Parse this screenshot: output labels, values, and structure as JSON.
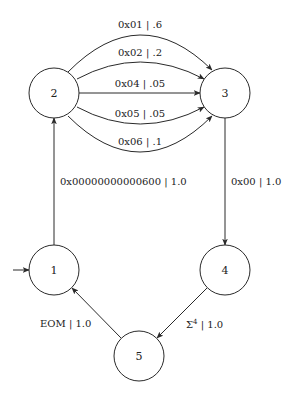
{
  "diagram": {
    "type": "state-machine",
    "nodes": [
      {
        "id": "1",
        "label": "1",
        "initial": true
      },
      {
        "id": "2",
        "label": "2"
      },
      {
        "id": "3",
        "label": "3"
      },
      {
        "id": "4",
        "label": "4"
      },
      {
        "id": "5",
        "label": "5"
      }
    ],
    "edges": [
      {
        "from": "1",
        "to": "2",
        "label": "0x00000000000600 | 1.0"
      },
      {
        "from": "2",
        "to": "3",
        "label": "0x01 | .6"
      },
      {
        "from": "2",
        "to": "3",
        "label": "0x02 | .2"
      },
      {
        "from": "2",
        "to": "3",
        "label": "0x04 | .05"
      },
      {
        "from": "2",
        "to": "3",
        "label": "0x05 | .05"
      },
      {
        "from": "2",
        "to": "3",
        "label": "0x06 | .1"
      },
      {
        "from": "3",
        "to": "4",
        "label": "0x00 | 1.0"
      },
      {
        "from": "4",
        "to": "5",
        "label_base": "Σ",
        "label_sup": "4",
        "label_rest": " | 1.0"
      },
      {
        "from": "5",
        "to": "1",
        "label": "EOM | 1.0"
      }
    ]
  }
}
